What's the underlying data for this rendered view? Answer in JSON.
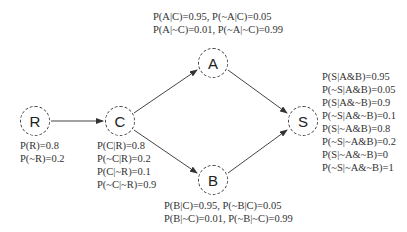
{
  "nodes": {
    "R": {
      "label": "R"
    },
    "C": {
      "label": "C"
    },
    "A": {
      "label": "A"
    },
    "B": {
      "label": "B"
    },
    "S": {
      "label": "S"
    }
  },
  "edges": [
    {
      "from": "R",
      "to": "C"
    },
    {
      "from": "C",
      "to": "A"
    },
    {
      "from": "C",
      "to": "B"
    },
    {
      "from": "A",
      "to": "S"
    },
    {
      "from": "B",
      "to": "S"
    }
  ],
  "cpt": {
    "R": [
      "P(R)=0.8",
      "P(~R)=0.2"
    ],
    "C": [
      "P(C|R)=0.8",
      "P(~C|R)=0.2",
      "P(C|~R)=0.1",
      "P(~C|~R)=0.9"
    ],
    "A": [
      "P(A|C)=0.95, P(~A|C)=0.05",
      "P(A|~C)=0.01, P(~A|~C)=0.99"
    ],
    "B": [
      "P(B|C)=0.95, P(~B|C)=0.05",
      "P(B|~C)=0.01, P(~B|~C)=0.99"
    ],
    "S": [
      "P(S|A&B)=0.95",
      "P(~S|A&B)=0.05",
      "P(S|A&~B)=0.9",
      "P(~S|A&~B)=0.1",
      "P(S|~A&B)=0.8",
      "P(~S|~A&B)=0.2",
      "P(S|~A&~B)=0",
      "P(~S|~A&~B)=1"
    ]
  },
  "colors": {
    "line": "#444444",
    "text": "#333333"
  }
}
